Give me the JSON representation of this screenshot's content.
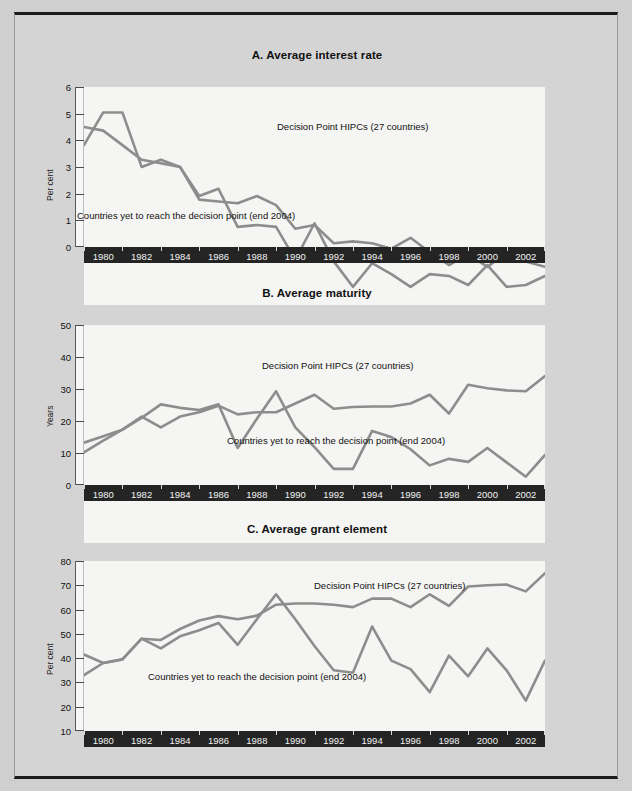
{
  "figure": {
    "background_color": "#d4d4d4",
    "line_color": "#8d8d8d",
    "axis_band_color": "#242424"
  },
  "panels": [
    {
      "id": "A",
      "title": "A. Average interest rate",
      "ylabel": "Per cent",
      "note_top": "Decision Point HIPCs (27 countries)",
      "note_bottom": "Countries yet to reach the decision point (end 2004)"
    },
    {
      "id": "B",
      "title": "B. Average maturity",
      "ylabel": "Years",
      "note_top": "Decision Point HIPCs (27 countries)",
      "note_bottom": "Countries yet to reach the decision point (end 2004)"
    },
    {
      "id": "C",
      "title": "C. Average grant element",
      "ylabel": "Per cent",
      "note_top": "Decision Point HIPCs (27 countries)",
      "note_bottom": "Countries yet to reach the decision point (end 2004)"
    }
  ],
  "chart_data": [
    {
      "type": "line",
      "id": "A",
      "title": "A. Average interest rate",
      "xlabel": "",
      "ylabel": "Per cent",
      "ylim": [
        0,
        6
      ],
      "yticks": [
        0,
        1,
        2,
        3,
        4,
        5,
        6
      ],
      "xlim": [
        1980,
        2004
      ],
      "xticks": [
        1980,
        1982,
        1984,
        1986,
        1988,
        1990,
        1992,
        1994,
        1996,
        1998,
        2000,
        2002,
        2004
      ],
      "xtick_labels": [
        "1980",
        "1982",
        "1984",
        "1986",
        "1988",
        "1990",
        "1992",
        "1994",
        "1996",
        "1998",
        "2000",
        "2002",
        "2004"
      ],
      "grid": false,
      "legend_position": "inline-annotations",
      "x": [
        1980,
        1981,
        1982,
        1983,
        1984,
        1985,
        1986,
        1987,
        1988,
        1989,
        1990,
        1991,
        1992,
        1993,
        1994,
        1995,
        1996,
        1997,
        1998,
        1999,
        2000,
        2001,
        2002,
        2003,
        2004
      ],
      "series": [
        {
          "name": "Decision Point HIPCs (27 countries)",
          "values": [
            4.4,
            5.3,
            5.3,
            3.8,
            4.0,
            3.8,
            2.9,
            2.85,
            2.8,
            3.0,
            2.75,
            2.1,
            2.2,
            1.7,
            1.75,
            1.7,
            1.55,
            1.85,
            1.45,
            1.1,
            1.4,
            1.05,
            1.45,
            1.2,
            1.05
          ]
        },
        {
          "name": "Countries yet to reach the decision point (end 2004)",
          "values": [
            4.9,
            4.8,
            4.4,
            4.0,
            3.9,
            3.8,
            3.0,
            3.2,
            2.15,
            2.2,
            2.15,
            1.25,
            2.25,
            1.2,
            0.5,
            1.15,
            0.85,
            0.5,
            0.85,
            0.8,
            0.55,
            1.1,
            0.5,
            0.55,
            0.8
          ]
        }
      ]
    },
    {
      "type": "line",
      "id": "B",
      "title": "B. Average maturity",
      "xlabel": "",
      "ylabel": "Years",
      "ylim": [
        0,
        50
      ],
      "yticks": [
        0,
        10,
        20,
        30,
        40,
        50
      ],
      "xlim": [
        1980,
        2004
      ],
      "xticks": [
        1980,
        1982,
        1984,
        1986,
        1988,
        1990,
        1992,
        1994,
        1996,
        1998,
        2000,
        2002,
        2004
      ],
      "xtick_labels": [
        "1980",
        "1982",
        "1984",
        "1986",
        "1988",
        "1990",
        "1992",
        "1994",
        "1996",
        "1998",
        "2000",
        "2002",
        "2004"
      ],
      "grid": false,
      "legend_position": "inline-annotations",
      "x": [
        1980,
        1981,
        1982,
        1983,
        1984,
        1985,
        1986,
        1987,
        1988,
        1989,
        1990,
        1991,
        1992,
        1993,
        1994,
        1995,
        1996,
        1997,
        1998,
        1999,
        2000,
        2001,
        2002,
        2003,
        2004
      ],
      "series": [
        {
          "name": "Decision Point HIPCs (27 countries)",
          "values": [
            23,
            24.5,
            26,
            29,
            26.5,
            29,
            30,
            31.5,
            29.5,
            30,
            30,
            32,
            34,
            30.8,
            31.2,
            31.3,
            31.3,
            32,
            34,
            29.7,
            36.3,
            35.5,
            35,
            34.8,
            38.3
          ]
        },
        {
          "name": "Countries yet to reach the decision point (end 2004)",
          "values": [
            20.8,
            23.5,
            26,
            28.7,
            31.8,
            31,
            30.5,
            31.8,
            21.8,
            28.5,
            34.8,
            26.5,
            22,
            17,
            17,
            25.7,
            24.3,
            21.5,
            17.8,
            19.3,
            18.6,
            21.8,
            18.5,
            15.2,
            20.2
          ]
        }
      ]
    },
    {
      "type": "line",
      "id": "C",
      "title": "C. Average grant element",
      "xlabel": "",
      "ylabel": "Per cent",
      "ylim": [
        10,
        80
      ],
      "yticks": [
        10,
        20,
        30,
        40,
        50,
        60,
        70,
        80
      ],
      "xlim": [
        1980,
        2004
      ],
      "xticks": [
        1980,
        1982,
        1984,
        1986,
        1988,
        1990,
        1992,
        1994,
        1996,
        1998,
        2000,
        2002,
        2004
      ],
      "xtick_labels": [
        "1980",
        "1982",
        "1984",
        "1986",
        "1988",
        "1990",
        "1992",
        "1994",
        "1996",
        "1998",
        "2000",
        "2002",
        "2004"
      ],
      "grid": false,
      "legend_position": "inline-annotations",
      "x": [
        1980,
        1981,
        1982,
        1983,
        1984,
        1985,
        1986,
        1987,
        1988,
        1989,
        1990,
        1991,
        1992,
        1993,
        1994,
        1995,
        1996,
        1997,
        1998,
        1999,
        2000,
        2001,
        2002,
        2003,
        2004
      ],
      "series": [
        {
          "name": "Decision Point HIPCs (27 countries)",
          "values": [
            41.5,
            38,
            39.5,
            48,
            47.5,
            52,
            55.5,
            57.3,
            56,
            57.5,
            62,
            62.5,
            62.5,
            62,
            61,
            64.5,
            64.5,
            61,
            66.3,
            61.5,
            69.5,
            70,
            70.3,
            67.5,
            75
          ]
        },
        {
          "name": "Countries yet to reach the decision point (end 2004)",
          "values": [
            33,
            38,
            39.5,
            48,
            44,
            49,
            51.5,
            54.5,
            45.5,
            56,
            66.3,
            56,
            45,
            35,
            34,
            53,
            39,
            35.5,
            26,
            41,
            32.5,
            44,
            35,
            22.5,
            39
          ]
        }
      ]
    }
  ]
}
